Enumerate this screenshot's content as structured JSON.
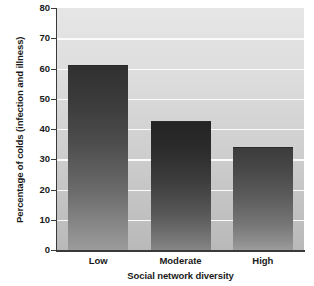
{
  "chart_data": {
    "type": "bar",
    "title": "",
    "subtitle": "",
    "xlabel": "Social network diversity",
    "ylabel": "Percentage of colds (infection and illness)",
    "categories": [
      "Low",
      "Moderate",
      "High"
    ],
    "values": [
      61,
      42.5,
      34
    ],
    "ylim": [
      0,
      80
    ],
    "yticks": [
      0,
      10,
      20,
      30,
      40,
      50,
      60,
      70,
      80
    ],
    "ytick_labels": [
      "0",
      "10",
      "20",
      "30",
      "40",
      "50",
      "60",
      "70",
      "80"
    ],
    "grid": true,
    "grid_axis": "y",
    "grid_color": "#fbfbfb",
    "legend": false,
    "legend_position": "none",
    "bar_colors": [
      "#4d4d4d",
      "#3c3c3c",
      "#5c5c5c"
    ],
    "plot_background": "#d2d2d2",
    "axis_color": "#3a3a3a",
    "annotations": []
  },
  "axes": {
    "y_title": "Percentage of colds (infection and illness)",
    "x_title": "Social network diversity"
  }
}
